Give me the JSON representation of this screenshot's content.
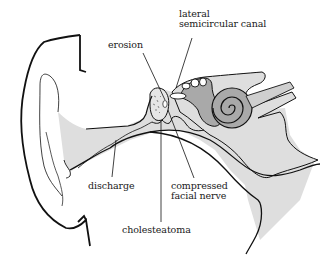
{
  "diagram": {
    "colors": {
      "outline": "#111111",
      "light_fill": "#dedede",
      "mid_fill": "#a9a9a9",
      "background": "#ffffff"
    },
    "labels": {
      "lateral_semicircular_canal_line1": "lateral",
      "lateral_semicircular_canal_line2": "semicircular canal",
      "erosion": "erosion",
      "discharge": "discharge",
      "compressed_facial_nerve_line1": "compressed",
      "compressed_facial_nerve_line2": "facial nerve",
      "cholesteatoma": "cholesteatoma"
    }
  }
}
